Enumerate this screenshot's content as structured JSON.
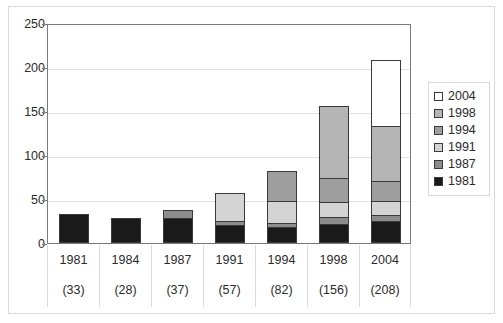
{
  "chart_data": {
    "type": "bar",
    "stacked": true,
    "title": "",
    "xlabel": "",
    "ylabel": "",
    "ylim": [
      0,
      250
    ],
    "yticks": [
      0,
      50,
      100,
      150,
      200,
      250
    ],
    "grid": true,
    "legend_position": "right",
    "categories": [
      "1981",
      "1984",
      "1987",
      "1991",
      "1994",
      "1998",
      "2004"
    ],
    "category_sublabels": [
      "(33)",
      "(28)",
      "(37)",
      "(57)",
      "(82)",
      "(156)",
      "(208)"
    ],
    "totals": [
      33,
      28,
      37,
      57,
      82,
      156,
      208
    ],
    "series": [
      {
        "name": "1981",
        "color": "#1a1a1a",
        "values": [
          33,
          28,
          28,
          20,
          18,
          22,
          25
        ]
      },
      {
        "name": "1987",
        "color": "#8c8c8c",
        "values": [
          0,
          0,
          9,
          5,
          5,
          7,
          7
        ]
      },
      {
        "name": "1991",
        "color": "#d4d4d4",
        "values": [
          0,
          0,
          0,
          32,
          25,
          18,
          16
        ]
      },
      {
        "name": "1994",
        "color": "#9e9e9e",
        "values": [
          0,
          0,
          0,
          0,
          34,
          27,
          23
        ]
      },
      {
        "name": "1998",
        "color": "#b5b5b5",
        "values": [
          0,
          0,
          0,
          0,
          0,
          82,
          62
        ]
      },
      {
        "name": "2004",
        "color": "#ffffff",
        "values": [
          0,
          0,
          0,
          0,
          0,
          0,
          75
        ]
      }
    ],
    "legend_entries": [
      {
        "label": "2004",
        "color": "#ffffff"
      },
      {
        "label": "1998",
        "color": "#b5b5b5"
      },
      {
        "label": "1994",
        "color": "#9e9e9e"
      },
      {
        "label": "1991",
        "color": "#d4d4d4"
      },
      {
        "label": "1987",
        "color": "#8c8c8c"
      },
      {
        "label": "1981",
        "color": "#1a1a1a"
      }
    ]
  },
  "axis": {
    "y_tick_labels": [
      "250",
      "200",
      "150",
      "100",
      "50",
      "0"
    ]
  }
}
